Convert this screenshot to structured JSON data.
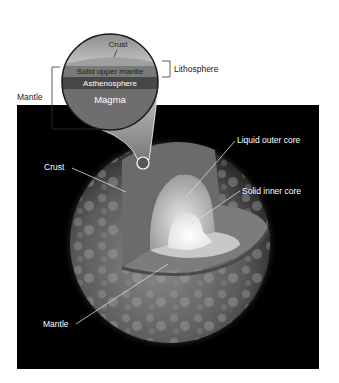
{
  "figure": {
    "inset": {
      "layers": [
        {
          "id": "crust",
          "label": "Crust",
          "color": "#a9a9a9"
        },
        {
          "id": "solid-upper-mantle",
          "label": "Solid upper mantle",
          "color": "#7a7a7a"
        },
        {
          "id": "asthenosphere",
          "label": "Asthenosphere",
          "color": "#4a4a4a"
        },
        {
          "id": "magma",
          "label": "Magma",
          "color": "#6e6e6e"
        }
      ],
      "brackets": {
        "lithosphere": "Lithosphere",
        "mantle": "Mantle"
      }
    },
    "globe_labels": {
      "crust": "Crust",
      "liquid_outer_core": "Liquid outer core",
      "solid_inner_core": "Solid inner core",
      "mantle": "Mantle"
    },
    "colors": {
      "panel_bg": "#000000",
      "label_text_dark": "#222222",
      "label_text_light": "#ffffff",
      "leader_line": "#dddddd"
    }
  }
}
